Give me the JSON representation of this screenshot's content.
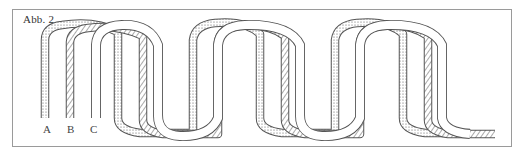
{
  "figure": {
    "caption": "Abb. 2",
    "labels": [
      {
        "id": "A",
        "text": "A",
        "x": 43
      },
      {
        "id": "B",
        "text": "B",
        "x": 67
      },
      {
        "id": "C",
        "text": "C",
        "x": 90
      }
    ],
    "bands": [
      {
        "id": "A",
        "fill": "stipple",
        "description": "dotted band"
      },
      {
        "id": "B",
        "fill": "hatch",
        "description": "diagonally hatched band"
      },
      {
        "id": "C",
        "fill": "outline",
        "description": "hollow outlined band"
      }
    ],
    "colors": {
      "stroke": "#555555",
      "frame": "#9a9a9a",
      "background": "#ffffff"
    }
  }
}
